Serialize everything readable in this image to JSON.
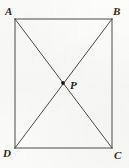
{
  "figure": {
    "kind": "geometry-diagram",
    "shape": "rectangle",
    "background_color": "#fbfbfa",
    "stroke_color": "#4a4a4a",
    "stroke_width": 1,
    "point_marker_color": "#1c1c1c",
    "vertices": [
      {
        "id": "A",
        "label": "A",
        "x": 15,
        "y": 19,
        "corner": "top-left"
      },
      {
        "id": "B",
        "label": "B",
        "x": 112,
        "y": 19,
        "corner": "top-right"
      },
      {
        "id": "C",
        "label": "C",
        "x": 112,
        "y": 148,
        "corner": "bottom-right"
      },
      {
        "id": "D",
        "label": "D",
        "x": 15,
        "y": 148,
        "corner": "bottom-left"
      }
    ],
    "sides": [
      {
        "id": "AB",
        "from": "A",
        "to": "B"
      },
      {
        "id": "BC",
        "from": "B",
        "to": "C"
      },
      {
        "id": "CD",
        "from": "C",
        "to": "D"
      },
      {
        "id": "DA",
        "from": "D",
        "to": "A"
      }
    ],
    "diagonals": [
      {
        "id": "AC",
        "from": "A",
        "to": "C"
      },
      {
        "id": "BD",
        "from": "B",
        "to": "D"
      }
    ],
    "interior_points": [
      {
        "id": "P",
        "label": "P",
        "x": 63,
        "y": 83,
        "marker": "filled-dot",
        "radius": 1.8
      }
    ]
  }
}
